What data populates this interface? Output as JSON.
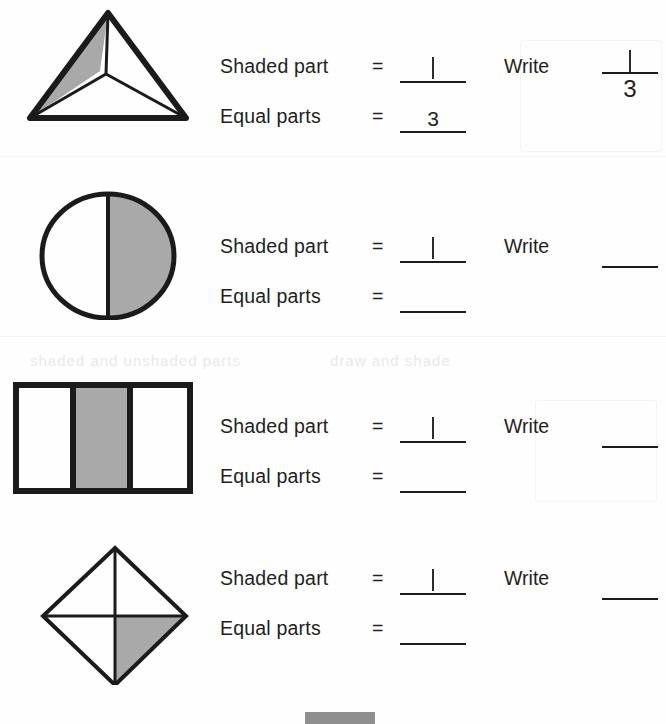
{
  "worksheet": {
    "shaded_label": "Shaded part",
    "equal_label": "Equal parts",
    "equals_sign": "=",
    "write_label": "Write",
    "colors": {
      "shade_fill": "#a9a9a9",
      "stroke": "#1b1b1b",
      "paper": "#fefefe",
      "bottom_marker": "#8f8f8f"
    }
  },
  "rows": [
    {
      "id": "row-triangle",
      "figure": "triangle-thirds",
      "figure_name": "triangle-divided-in-thirds",
      "shaded_value": "1",
      "shaded_is_handwritten": true,
      "equal_value": "3",
      "equal_is_handwritten": false,
      "write_label": "Write",
      "fraction_numerator": "1",
      "fraction_denominator": "3",
      "fraction_numerator_handwritten": true
    },
    {
      "id": "row-circle",
      "figure": "circle-halves",
      "figure_name": "circle-divided-in-halves",
      "shaded_value": "1",
      "shaded_is_handwritten": true,
      "equal_value": "",
      "equal_is_handwritten": false,
      "write_label": "Write",
      "fraction_numerator": "",
      "fraction_denominator": "",
      "fraction_numerator_handwritten": false
    },
    {
      "id": "row-rectangle",
      "figure": "rectangle-thirds",
      "figure_name": "rectangle-divided-in-thirds",
      "shaded_value": "1",
      "shaded_is_handwritten": true,
      "equal_value": "",
      "equal_is_handwritten": false,
      "write_label": "Write",
      "fraction_numerator": "",
      "fraction_denominator": "",
      "fraction_numerator_handwritten": false
    },
    {
      "id": "row-diamond",
      "figure": "diamond-quarters",
      "figure_name": "diamond-divided-in-quarters",
      "shaded_value": "1",
      "shaded_is_handwritten": true,
      "equal_value": "",
      "equal_is_handwritten": false,
      "write_label": "Write",
      "fraction_numerator": "",
      "fraction_denominator": "",
      "fraction_numerator_handwritten": false
    }
  ],
  "bleed_text": [
    "shaded and unshaded parts",
    "draw and shade"
  ]
}
